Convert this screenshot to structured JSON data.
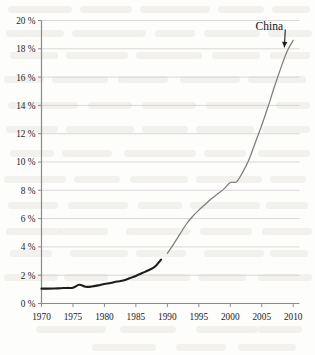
{
  "chart_data": {
    "type": "line",
    "title": "",
    "subtitle": "",
    "xlabel": "",
    "ylabel": "",
    "xlim": [
      1970,
      2011
    ],
    "ylim": [
      0,
      20
    ],
    "grid": true,
    "legend_position": "none",
    "x_ticks": [
      1970,
      1975,
      1980,
      1985,
      1990,
      1995,
      2000,
      2005,
      2010
    ],
    "x_tick_labels": [
      "1970",
      "1975",
      "1980",
      "1985",
      "1990",
      "1995",
      "2000",
      "2005",
      "2010"
    ],
    "y_ticks": [
      0,
      2,
      4,
      6,
      8,
      10,
      12,
      14,
      16,
      18,
      20
    ],
    "y_tick_labels": [
      "0 %",
      "2 %",
      "4 %",
      "6 %",
      "8 %",
      "10 %",
      "12 %",
      "14 %",
      "16 %",
      "18 %",
      "20 %"
    ],
    "annotations": [
      {
        "text": "China",
        "x": 2006.2,
        "y": 19.3,
        "arrow_to_x": 2008.6,
        "arrow_to_y": 18.1
      }
    ],
    "series": [
      {
        "name": "China (1970-1989)",
        "style": "thick-dark",
        "color": "#1d1d1d",
        "x": [
          1970,
          1971,
          1972,
          1973,
          1974,
          1975,
          1976,
          1977,
          1978,
          1979,
          1980,
          1981,
          1982,
          1983,
          1984,
          1985,
          1986,
          1987,
          1988,
          1989
        ],
        "values": [
          1.05,
          1.05,
          1.06,
          1.08,
          1.1,
          1.12,
          1.32,
          1.18,
          1.2,
          1.28,
          1.38,
          1.45,
          1.55,
          1.62,
          1.78,
          1.95,
          2.15,
          2.35,
          2.6,
          3.1
        ]
      },
      {
        "name": "China (1990-2010)",
        "style": "thin-gray",
        "color": "#7d7d7d",
        "x": [
          1990,
          1991,
          1992,
          1993,
          1994,
          1995,
          1996,
          1997,
          1998,
          1999,
          2000,
          2001,
          2002,
          2003,
          2004,
          2005,
          2006,
          2007,
          2008,
          2009,
          2010
        ],
        "values": [
          3.55,
          4.2,
          4.9,
          5.6,
          6.15,
          6.6,
          7.0,
          7.4,
          7.75,
          8.1,
          8.55,
          8.6,
          9.3,
          10.2,
          11.4,
          12.6,
          13.9,
          15.3,
          16.6,
          17.8,
          18.6
        ]
      }
    ]
  }
}
